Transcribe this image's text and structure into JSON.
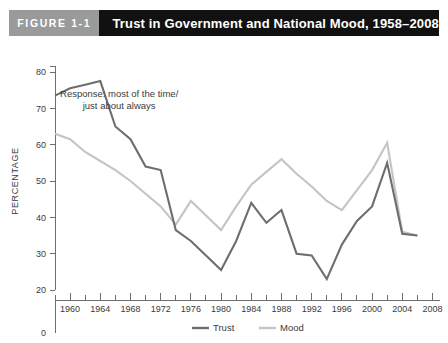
{
  "header": {
    "figure_number": "FIGURE 1-1",
    "title": "Trust in Government and National Mood, 1958–2008",
    "number_box_color": "#9a9a9a",
    "title_box_color": "#111111"
  },
  "chart_data": {
    "type": "line",
    "title": "Trust in Government and National Mood, 1958–2008",
    "xlabel": "",
    "ylabel": "PERCENTAGE",
    "xlim": [
      1958,
      2009
    ],
    "ylim": [
      20,
      80
    ],
    "y_zero_shown": true,
    "yticks": [
      20,
      30,
      40,
      50,
      60,
      70,
      80
    ],
    "ytick_labels": [
      "20",
      "30",
      "40",
      "50",
      "60",
      "70",
      "80"
    ],
    "y_axis_break_label": "0",
    "xticks": [
      1960,
      1964,
      1968,
      1972,
      1976,
      1980,
      1984,
      1988,
      1992,
      1996,
      2000,
      2004,
      2008
    ],
    "xtick_labels": [
      "1960",
      "1964",
      "1968",
      "1972",
      "1976",
      "1980",
      "1984",
      "1988",
      "1992",
      "1996",
      "2000",
      "2004",
      "2008"
    ],
    "x_minor_tick_interval": 2,
    "grid": false,
    "legend_position": "bottom-center",
    "annotations": [
      {
        "line1": "Response: most of the time/",
        "line2": "just about always",
        "x": 1966.5,
        "y": 73
      }
    ],
    "series": [
      {
        "name": "Trust",
        "color": "#6e6e6e",
        "x": [
          1958,
          1960,
          1962,
          1964,
          1966,
          1968,
          1970,
          1972,
          1974,
          1976,
          1978,
          1980,
          1982,
          1984,
          1986,
          1988,
          1990,
          1992,
          1994,
          1996,
          1998,
          2000,
          2002,
          2004,
          2006
        ],
        "values": [
          73.5,
          75.5,
          76.5,
          77.5,
          65.0,
          61.5,
          54.0,
          53.0,
          36.5,
          33.5,
          29.5,
          25.5,
          33.5,
          44.0,
          38.5,
          42.0,
          30.0,
          29.5,
          23.0,
          32.5,
          39.0,
          43.0,
          55.0,
          35.5,
          35.0
        ]
      },
      {
        "name": "Mood",
        "color": "#c4c4c4",
        "x": [
          1958,
          1960,
          1962,
          1964,
          1966,
          1968,
          1970,
          1972,
          1974,
          1976,
          1978,
          1980,
          1982,
          1984,
          1986,
          1988,
          1990,
          1992,
          1994,
          1996,
          1998,
          2000,
          2002,
          2004,
          2006
        ],
        "values": [
          63.0,
          61.5,
          58.0,
          55.5,
          53.0,
          50.0,
          46.5,
          43.0,
          38.0,
          44.5,
          40.5,
          36.5,
          43.0,
          49.0,
          52.5,
          56.0,
          52.0,
          48.5,
          44.5,
          42.0,
          47.5,
          53.0,
          60.5,
          36.0,
          35.0
        ]
      }
    ],
    "legend": [
      {
        "label": "Trust",
        "color": "#6e6e6e"
      },
      {
        "label": "Mood",
        "color": "#c4c4c4"
      }
    ]
  }
}
